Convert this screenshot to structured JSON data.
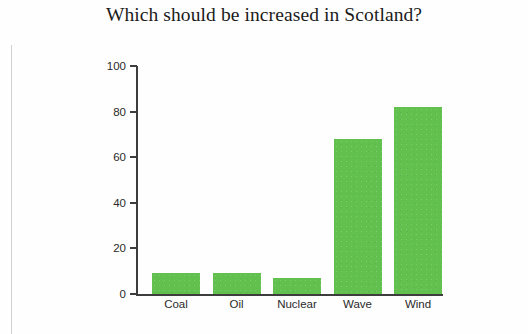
{
  "chart_data": {
    "type": "bar",
    "title": "Which should be increased in Scotland?",
    "xlabel": "",
    "ylabel": "",
    "categories": [
      "Coal",
      "Oil",
      "Nuclear",
      "Wave",
      "Wind"
    ],
    "values": [
      9,
      9,
      7,
      68,
      82
    ],
    "ylim": [
      0,
      100
    ],
    "yticks": [
      0,
      20,
      40,
      60,
      80,
      100
    ],
    "ytick_labels": [
      "0",
      "20",
      "40",
      "60",
      "80",
      "100"
    ],
    "grid": false,
    "legend": null,
    "bar_color": "#62c04f",
    "axis_color": "#3d3d3d",
    "text_color": "#2a2a2a",
    "title_color": "#1b1b1b",
    "background": "#fefefe",
    "annotations": []
  }
}
